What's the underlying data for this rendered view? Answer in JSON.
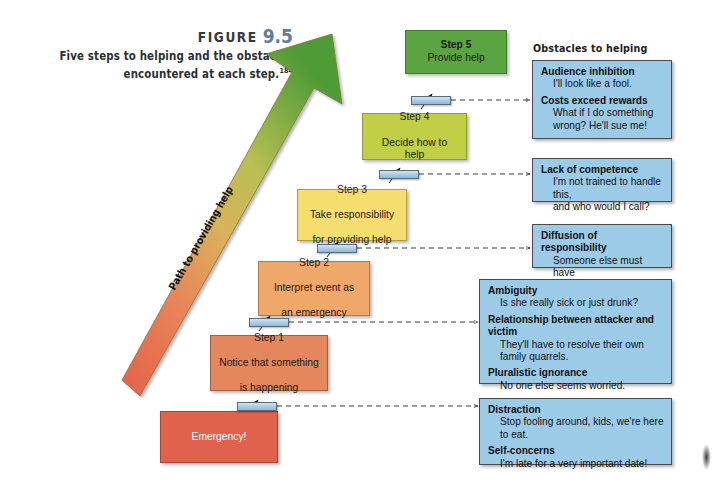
{
  "figure": {
    "label": "FIGURE",
    "number": "9.5",
    "caption_line1": "Five steps to helping and the obstacles",
    "caption_line2": "encountered at each step.",
    "caption_superscript": "184"
  },
  "arrow": {
    "label": "Path to providing help",
    "color_start": "#e0614c",
    "color_end": "#4f9b36"
  },
  "steps": [
    {
      "id": "step5",
      "title": "Step 5",
      "line2": "Provide help",
      "line3": "",
      "color": "#5aa541"
    },
    {
      "id": "step4",
      "title": "Step 4",
      "line2": "Decide how to help",
      "line3": "",
      "color": "#c0cf43"
    },
    {
      "id": "step3",
      "title": "Step 3",
      "line2": "Take responsibility",
      "line3": "for providing help",
      "color": "#f6de6e"
    },
    {
      "id": "step2",
      "title": "Step 2",
      "line2": "Interpret event as",
      "line3": "an emergency",
      "color": "#efa76a"
    },
    {
      "id": "step1",
      "title": "Step 1",
      "line2": "Notice that something",
      "line3": "is happening",
      "color": "#e5875c"
    },
    {
      "id": "emergency",
      "title": "Emergency!",
      "line2": "",
      "line3": "",
      "color": "#e0614c"
    }
  ],
  "obstacles_header": "Obstacles to helping",
  "obstacles": [
    {
      "id": "obstacle-step5",
      "entries": [
        {
          "title": "Audience inhibition",
          "body": [
            "I'll look like a fool."
          ]
        },
        {
          "title": "Costs exceed rewards",
          "body": [
            "What if I do something",
            "wrong? He'll sue me!"
          ]
        }
      ]
    },
    {
      "id": "obstacle-step4",
      "entries": [
        {
          "title": "Lack of competence",
          "body": [
            "I'm not trained to handle this,",
            "and who would I call?"
          ]
        }
      ]
    },
    {
      "id": "obstacle-step3",
      "entries": [
        {
          "title": "Diffusion of responsibility",
          "body": [
            "Someone else must have",
            "called 911."
          ]
        }
      ]
    },
    {
      "id": "obstacle-step2",
      "entries": [
        {
          "title": "Ambiguity",
          "body": [
            "Is she really sick or just drunk?"
          ]
        },
        {
          "title": "Relationship between attacker and victim",
          "body": [
            "They'll  have to resolve their own",
            "family quarrels."
          ]
        },
        {
          "title": "Pluralistic ignorance",
          "body": [
            "No one else seems worried."
          ]
        }
      ]
    },
    {
      "id": "obstacle-step1",
      "entries": [
        {
          "title": "Distraction",
          "body": [
            "Stop fooling around, kids, we're here to eat."
          ]
        },
        {
          "title": "Self-concerns",
          "body": [
            "I'm late for a very important date!"
          ]
        }
      ]
    }
  ],
  "colors": {
    "obstacle_fill": "#9ccbe8",
    "obstacle_border": "#4a4a4a",
    "barrier_fill": "#a9cbe3",
    "figure_number": "#5d7d9a"
  }
}
